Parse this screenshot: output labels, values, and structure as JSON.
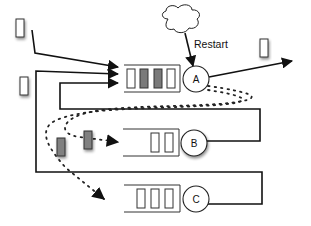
{
  "diagram": {
    "type": "queueing-flow",
    "colors": {
      "line": "#111111",
      "job_filled": "#7a7a7a",
      "job_empty": "#ffffff",
      "background": "#ffffff"
    },
    "labels": {
      "restart": "Restart",
      "server_a": "A",
      "server_b": "B",
      "server_c": "C"
    },
    "nodes": [
      {
        "id": "cloud",
        "kind": "cloud",
        "label": ""
      },
      {
        "id": "A",
        "kind": "server",
        "label": "A",
        "queue_slots": [
          "empty",
          "filled",
          "filled",
          "empty"
        ]
      },
      {
        "id": "B",
        "kind": "server",
        "label": "B",
        "queue_slots": [
          "empty",
          "empty"
        ]
      },
      {
        "id": "C",
        "kind": "server",
        "label": "C",
        "queue_slots": [
          "empty",
          "empty",
          "empty"
        ]
      }
    ],
    "edges": [
      {
        "from": "external-job-1",
        "to": "A",
        "style": "solid"
      },
      {
        "from": "loop-outer",
        "to": "A",
        "style": "solid"
      },
      {
        "from": "loop-inner",
        "to": "A",
        "style": "solid"
      },
      {
        "from": "cloud",
        "to": "A",
        "style": "solid",
        "label": "Restart"
      },
      {
        "from": "A",
        "to": "exit",
        "style": "solid"
      },
      {
        "from": "A",
        "to": "B",
        "style": "dotted"
      },
      {
        "from": "A",
        "to": "C",
        "style": "dotted"
      },
      {
        "from": "B",
        "to": "A",
        "style": "solid"
      },
      {
        "from": "C",
        "to": "A",
        "style": "solid"
      }
    ]
  }
}
